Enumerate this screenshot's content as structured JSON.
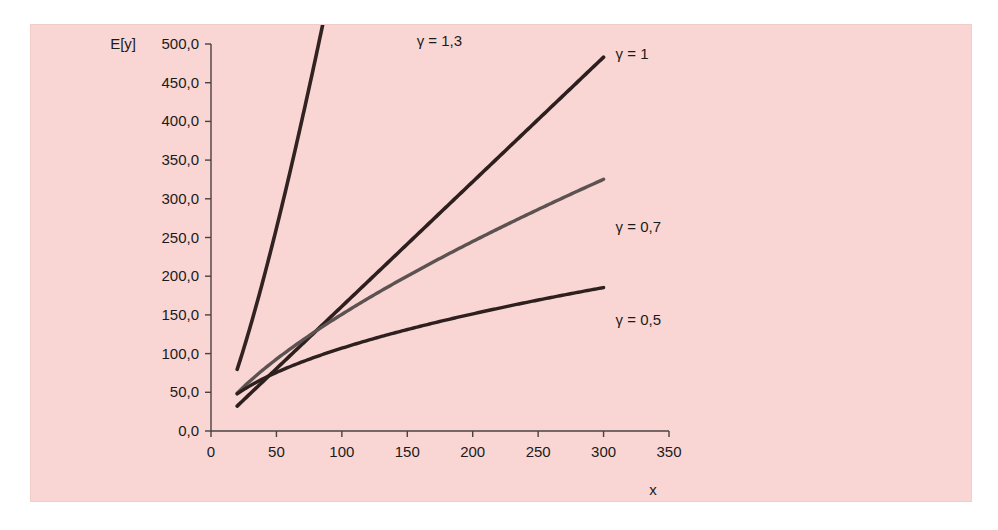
{
  "figure": {
    "background_color": "#ffffff",
    "panel_color": "#f9d6d3"
  },
  "chart_data": {
    "type": "line",
    "title": "",
    "subtitle": "",
    "xlabel": "x",
    "ylabel": "E[y]",
    "xlim": [
      0,
      350
    ],
    "ylim": [
      0,
      500
    ],
    "grid": false,
    "legend_position": "inline-right-of-curve-ends",
    "xticks": [
      0,
      50,
      100,
      150,
      200,
      250,
      300,
      350
    ],
    "xtick_labels": [
      "0",
      "50",
      "100",
      "150",
      "200",
      "250",
      "300",
      "350"
    ],
    "yticks": [
      0,
      50,
      100,
      150,
      200,
      250,
      300,
      350,
      400,
      450,
      500
    ],
    "ytick_labels": [
      "0,0",
      "50,0",
      "100,0",
      "150,0",
      "200,0",
      "250,0",
      "300,0",
      "350,0",
      "400,0",
      "450,0",
      "500,0"
    ],
    "series": [
      {
        "name": "gamma-1-3",
        "label": "γ = 1,3",
        "gamma": 1.3,
        "color": "#332222",
        "line_width": 3.6,
        "coefficient": 1.62,
        "x_start": 20,
        "x_end": 148,
        "x": [
          20,
          30,
          40,
          50,
          60,
          70,
          80,
          90,
          100,
          110,
          120,
          130,
          140,
          148
        ],
        "y": [
          72,
          118,
          167,
          220,
          275,
          332,
          392,
          453,
          515,
          579,
          644,
          710,
          778,
          833
        ],
        "label_x": 148,
        "label_y": 500
      },
      {
        "name": "gamma-1",
        "label": "γ = 1",
        "gamma": 1.0,
        "color": "#2e1f1f",
        "line_width": 3.6,
        "coefficient": 1.61,
        "x_start": 20,
        "x_end": 300,
        "x": [
          20,
          50,
          100,
          150,
          200,
          250,
          300
        ],
        "y": [
          48,
          113,
          208,
          300,
          362,
          425,
          483
        ],
        "label_x": 300,
        "label_y": 483
      },
      {
        "name": "gamma-0-7",
        "label": "γ = 0,7",
        "gamma": 0.7,
        "color": "#5c5252",
        "line_width": 3.4,
        "coefficient": 6.0,
        "x_start": 20,
        "x_end": 300,
        "x": [
          20,
          50,
          100,
          150,
          200,
          250,
          300
        ],
        "y": [
          48,
          90,
          145,
          192,
          214,
          238,
          260
        ],
        "label_x": 300,
        "label_y": 260
      },
      {
        "name": "gamma-0-5",
        "label": "γ = 0,5",
        "gamma": 0.5,
        "color": "#2f2020",
        "line_width": 3.4,
        "coefficient": 10.7,
        "x_start": 20,
        "x_end": 300,
        "x": [
          20,
          50,
          100,
          150,
          200,
          250,
          300
        ],
        "y": [
          48,
          66,
          87,
          105,
          118,
          130,
          139
        ],
        "label_x": 300,
        "label_y": 139
      }
    ]
  }
}
